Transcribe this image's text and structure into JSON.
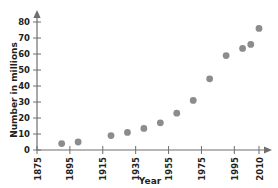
{
  "chart_data": {
    "type": "scatter",
    "title": "",
    "xlabel": "Year",
    "ylabel": "Number in millions",
    "xlim": [
      1875,
      2013
    ],
    "ylim": [
      0,
      85
    ],
    "grid": false,
    "legend": "none",
    "xticks": [
      "1875",
      "1895",
      "1915",
      "1935",
      "1955",
      "1975",
      "1995",
      "2010"
    ],
    "xtick_values": [
      1875,
      1895,
      1915,
      1935,
      1955,
      1975,
      1995,
      2010
    ],
    "yticks": [
      "0",
      "10",
      "20",
      "30",
      "40",
      "50",
      "60",
      "70",
      "80"
    ],
    "ytick_values": [
      0,
      10,
      20,
      30,
      40,
      50,
      60,
      70,
      80
    ],
    "x": [
      1890,
      1900,
      1920,
      1930,
      1940,
      1950,
      1960,
      1970,
      1980,
      1990,
      2000,
      2005,
      2010
    ],
    "values": [
      4,
      5,
      9,
      11,
      13.5,
      17,
      23,
      31,
      44.5,
      59,
      63.5,
      66,
      76
    ],
    "point_color": "#8c8c8c",
    "axis_color": "#6d6e71",
    "marker": "circle",
    "marker_size": 4.4
  },
  "labels": {
    "y_axis_title": "Number in millions",
    "x_axis_title": "Year"
  }
}
